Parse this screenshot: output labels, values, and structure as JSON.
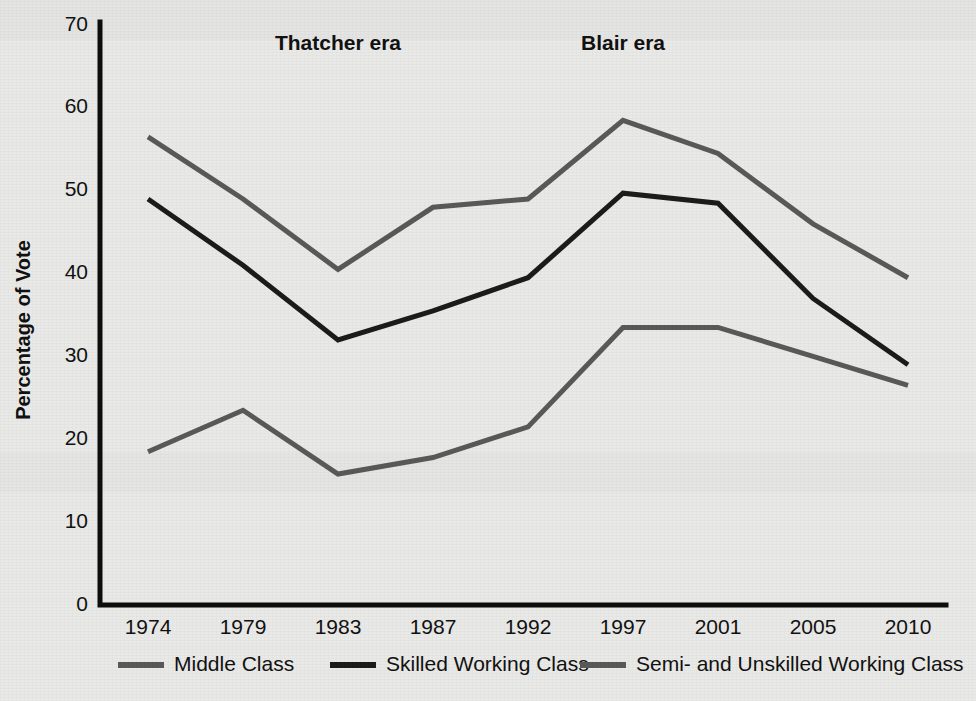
{
  "chart_data": {
    "type": "line",
    "title": "",
    "xlabel": "",
    "ylabel": "Percentage of Vote",
    "categories": [
      "1974",
      "1979",
      "1983",
      "1987",
      "1992",
      "1997",
      "2001",
      "2005",
      "2010"
    ],
    "ylim": [
      0,
      70
    ],
    "yticks": [
      0,
      10,
      20,
      30,
      40,
      50,
      60,
      70
    ],
    "ytick_labels": [
      "0",
      "10",
      "20",
      "30",
      "40",
      "50",
      "60",
      "70"
    ],
    "grid": false,
    "legend_position": "bottom",
    "series": [
      {
        "name": "Middle Class",
        "color": "#585858",
        "values": [
          56.5,
          49.0,
          40.5,
          48.0,
          49.0,
          58.5,
          54.5,
          46.0,
          39.5
        ]
      },
      {
        "name": "Skilled Working Class",
        "color": "#1b1b1b",
        "values": [
          49.0,
          41.0,
          32.0,
          35.5,
          39.5,
          49.7,
          48.5,
          37.0,
          29.0
        ]
      },
      {
        "name": "Semi- and Unskilled Working Class",
        "color": "#585858",
        "values": [
          18.5,
          23.5,
          15.8,
          17.8,
          21.5,
          33.5,
          33.5,
          30.0,
          26.5
        ]
      }
    ],
    "annotations": [
      {
        "text": "Thatcher era",
        "x_value": "1983",
        "y_value": 67
      },
      {
        "text": "Blair era",
        "x_value": "1997",
        "y_value": 67
      }
    ]
  },
  "axes": {
    "y_axis_label": "Percentage of Vote"
  },
  "legend": {
    "items": [
      {
        "label": "Middle Class"
      },
      {
        "label": "Skilled Working Class"
      },
      {
        "label": "Semi- and Unskilled Working Class"
      }
    ]
  }
}
